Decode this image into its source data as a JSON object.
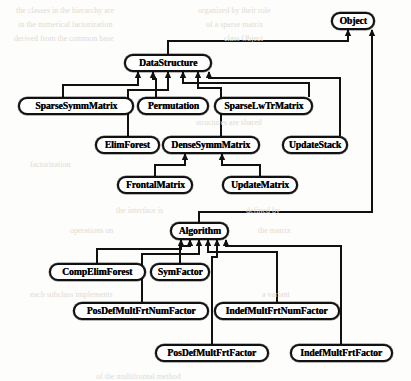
{
  "diagram": {
    "kind": "class-inheritance-hierarchy",
    "title": "",
    "canvas": {
      "width": 411,
      "height": 381
    },
    "style": {
      "box_fill": "#ffffff",
      "box_border": "#111111",
      "edge_color": "#111111",
      "text_color": "#000000",
      "background": "#fdfdfc",
      "corner_radius_px": 9
    },
    "nodes": [
      {
        "id": "object",
        "label": "Object",
        "x": 331,
        "y": 12,
        "w": 44,
        "h": 18
      },
      {
        "id": "datastructure",
        "label": "DataStructure",
        "x": 124,
        "y": 54,
        "w": 88,
        "h": 18
      },
      {
        "id": "sparsesymmmatrix",
        "label": "SparseSymmMatrix",
        "x": 18,
        "y": 97,
        "w": 116,
        "h": 18
      },
      {
        "id": "permutation",
        "label": "Permutation",
        "x": 137,
        "y": 97,
        "w": 72,
        "h": 18
      },
      {
        "id": "sparselwtrmatrix",
        "label": "SparseLwTrMatrix",
        "x": 214,
        "y": 97,
        "w": 99,
        "h": 18
      },
      {
        "id": "elimforest",
        "label": "ElimForest",
        "x": 95,
        "y": 136,
        "w": 65,
        "h": 18
      },
      {
        "id": "densesymmmatrix",
        "label": "DenseSymmMatrix",
        "x": 162,
        "y": 136,
        "w": 98,
        "h": 18
      },
      {
        "id": "updatestack",
        "label": "UpdateStack",
        "x": 282,
        "y": 136,
        "w": 66,
        "h": 18
      },
      {
        "id": "frontalmatrix",
        "label": "FrontalMatrix",
        "x": 117,
        "y": 176,
        "w": 76,
        "h": 18
      },
      {
        "id": "updatematrix",
        "label": "UpdateMatrix",
        "x": 222,
        "y": 176,
        "w": 76,
        "h": 18
      },
      {
        "id": "algorithm",
        "label": "Algorithm",
        "x": 170,
        "y": 222,
        "w": 59,
        "h": 18
      },
      {
        "id": "compelimforest",
        "label": "CompElimForest",
        "x": 49,
        "y": 263,
        "w": 97,
        "h": 18
      },
      {
        "id": "symfactor",
        "label": "SymFactor",
        "x": 150,
        "y": 263,
        "w": 60,
        "h": 18
      },
      {
        "id": "posdefmultfrtnumfactor",
        "label": "PosDefMultFrtNumFactor",
        "x": 73,
        "y": 302,
        "w": 136,
        "h": 18
      },
      {
        "id": "indefmultfrtnumfactor",
        "label": "IndefMultFrtNumFactor",
        "x": 214,
        "y": 302,
        "w": 126,
        "h": 18
      },
      {
        "id": "posdefmultfrtfactor",
        "label": "PosDefMultFrtFactor",
        "x": 155,
        "y": 344,
        "w": 114,
        "h": 18
      },
      {
        "id": "indefmultfrtfactor",
        "label": "IndefMultFrtFactor",
        "x": 290,
        "y": 344,
        "w": 103,
        "h": 18
      }
    ],
    "edges": [
      {
        "from": "datastructure",
        "to": "object",
        "relation": "inherits"
      },
      {
        "from": "algorithm",
        "to": "object",
        "relation": "inherits"
      },
      {
        "from": "sparsesymmmatrix",
        "to": "datastructure",
        "relation": "inherits"
      },
      {
        "from": "permutation",
        "to": "datastructure",
        "relation": "inherits"
      },
      {
        "from": "sparselwtrmatrix",
        "to": "datastructure",
        "relation": "inherits"
      },
      {
        "from": "elimforest",
        "to": "datastructure",
        "relation": "inherits"
      },
      {
        "from": "densesymmmatrix",
        "to": "datastructure",
        "relation": "inherits"
      },
      {
        "from": "updatestack",
        "to": "datastructure",
        "relation": "inherits"
      },
      {
        "from": "frontalmatrix",
        "to": "densesymmmatrix",
        "relation": "inherits"
      },
      {
        "from": "updatematrix",
        "to": "densesymmmatrix",
        "relation": "inherits"
      },
      {
        "from": "compelimforest",
        "to": "algorithm",
        "relation": "inherits"
      },
      {
        "from": "symfactor",
        "to": "algorithm",
        "relation": "inherits"
      },
      {
        "from": "posdefmultfrtnumfactor",
        "to": "algorithm",
        "relation": "inherits"
      },
      {
        "from": "indefmultfrtnumfactor",
        "to": "algorithm",
        "relation": "inherits"
      },
      {
        "from": "posdefmultfrtfactor",
        "to": "algorithm",
        "relation": "inherits"
      },
      {
        "from": "indefmultfrtfactor",
        "to": "algorithm",
        "relation": "inherits"
      }
    ],
    "routes": [
      {
        "id": "r-ds-object",
        "points": [
          [
            168,
            54
          ],
          [
            168,
            41
          ],
          [
            348,
            41
          ],
          [
            348,
            30
          ]
        ]
      },
      {
        "id": "r-alg-object",
        "points": [
          [
            199,
            222
          ],
          [
            199,
            212
          ],
          [
            372,
            212
          ],
          [
            372,
            30
          ]
        ]
      },
      {
        "id": "r-ssm-ds",
        "points": [
          [
            63,
            97
          ],
          [
            63,
            85
          ],
          [
            138,
            85
          ],
          [
            138,
            72
          ]
        ]
      },
      {
        "id": "r-perm-ds",
        "points": [
          [
            156,
            97
          ],
          [
            156,
            79
          ],
          [
            153,
            79
          ],
          [
            153,
            72
          ]
        ]
      },
      {
        "id": "r-slm-ds",
        "points": [
          [
            309,
            97
          ],
          [
            309,
            83
          ],
          [
            183,
            83
          ],
          [
            183,
            72
          ]
        ]
      },
      {
        "id": "r-ef-ds",
        "points": [
          [
            128,
            136
          ],
          [
            128,
            90
          ],
          [
            168,
            90
          ],
          [
            168,
            72
          ]
        ]
      },
      {
        "id": "r-dsm-ds",
        "points": [
          [
            221,
            136
          ],
          [
            221,
            88
          ],
          [
            198,
            88
          ],
          [
            198,
            72
          ]
        ]
      },
      {
        "id": "r-us-ds",
        "points": [
          [
            340,
            136
          ],
          [
            340,
            78
          ],
          [
            209,
            78
          ],
          [
            209,
            72
          ]
        ]
      },
      {
        "id": "r-fm-dsm",
        "points": [
          [
            155,
            176
          ],
          [
            155,
            165
          ],
          [
            185,
            165
          ],
          [
            185,
            154
          ]
        ]
      },
      {
        "id": "r-um-dsm",
        "points": [
          [
            260,
            176
          ],
          [
            260,
            165
          ],
          [
            222,
            165
          ],
          [
            222,
            154
          ]
        ]
      },
      {
        "id": "r-cef-alg",
        "points": [
          [
            97,
            263
          ],
          [
            97,
            249
          ],
          [
            181,
            249
          ],
          [
            181,
            240
          ]
        ]
      },
      {
        "id": "r-sf-alg",
        "points": [
          [
            180,
            263
          ],
          [
            180,
            246
          ],
          [
            190,
            246
          ],
          [
            190,
            240
          ]
        ]
      },
      {
        "id": "r-pdmfnf-alg",
        "points": [
          [
            142,
            302
          ],
          [
            142,
            254
          ],
          [
            199,
            254
          ],
          [
            199,
            240
          ]
        ]
      },
      {
        "id": "r-idmfnf-alg",
        "points": [
          [
            277,
            302
          ],
          [
            277,
            252
          ],
          [
            208,
            252
          ],
          [
            208,
            240
          ]
        ]
      },
      {
        "id": "r-pdmff-alg",
        "points": [
          [
            212,
            344
          ],
          [
            212,
            257
          ],
          [
            217,
            257
          ],
          [
            217,
            240
          ]
        ]
      },
      {
        "id": "r-idmff-alg",
        "points": [
          [
            341,
            344
          ],
          [
            341,
            246
          ],
          [
            226,
            246
          ],
          [
            226,
            240
          ]
        ]
      }
    ],
    "arrowheads": [
      {
        "at": [
          348,
          30
        ],
        "dir": "up"
      },
      {
        "at": [
          372,
          30
        ],
        "dir": "up"
      },
      {
        "at": [
          138,
          72
        ],
        "dir": "up"
      },
      {
        "at": [
          153,
          72
        ],
        "dir": "up"
      },
      {
        "at": [
          168,
          72
        ],
        "dir": "up"
      },
      {
        "at": [
          183,
          72
        ],
        "dir": "up"
      },
      {
        "at": [
          198,
          72
        ],
        "dir": "up"
      },
      {
        "at": [
          209,
          72
        ],
        "dir": "up"
      },
      {
        "at": [
          185,
          154
        ],
        "dir": "up"
      },
      {
        "at": [
          222,
          154
        ],
        "dir": "up"
      },
      {
        "at": [
          181,
          240
        ],
        "dir": "up"
      },
      {
        "at": [
          190,
          240
        ],
        "dir": "up"
      },
      {
        "at": [
          199,
          240
        ],
        "dir": "up"
      },
      {
        "at": [
          208,
          240
        ],
        "dir": "up"
      },
      {
        "at": [
          217,
          240
        ],
        "dir": "up"
      },
      {
        "at": [
          226,
          240
        ],
        "dir": "up"
      }
    ],
    "background_text": [
      {
        "text": "the classes in the hierarchy are",
        "x": 16,
        "y": 6
      },
      {
        "text": "organized by their role",
        "x": 198,
        "y": 6
      },
      {
        "text": "in the numerical factorization",
        "x": 18,
        "y": 20
      },
      {
        "text": "of a sparse matrix",
        "x": 206,
        "y": 20
      },
      {
        "text": "derived from the common base",
        "x": 14,
        "y": 34
      },
      {
        "text": "class Object",
        "x": 224,
        "y": 34
      },
      {
        "text": "structures are shared",
        "x": 196,
        "y": 118
      },
      {
        "text": "factorization",
        "x": 30,
        "y": 160
      },
      {
        "text": "the interface is",
        "x": 116,
        "y": 206
      },
      {
        "text": "defined by",
        "x": 246,
        "y": 206
      },
      {
        "text": "operations on",
        "x": 70,
        "y": 226
      },
      {
        "text": "the matrix",
        "x": 258,
        "y": 226
      },
      {
        "text": "each subclass implements",
        "x": 30,
        "y": 290
      },
      {
        "text": "a variant",
        "x": 262,
        "y": 290
      },
      {
        "text": "of the multifrontal method",
        "x": 96,
        "y": 372
      }
    ]
  }
}
